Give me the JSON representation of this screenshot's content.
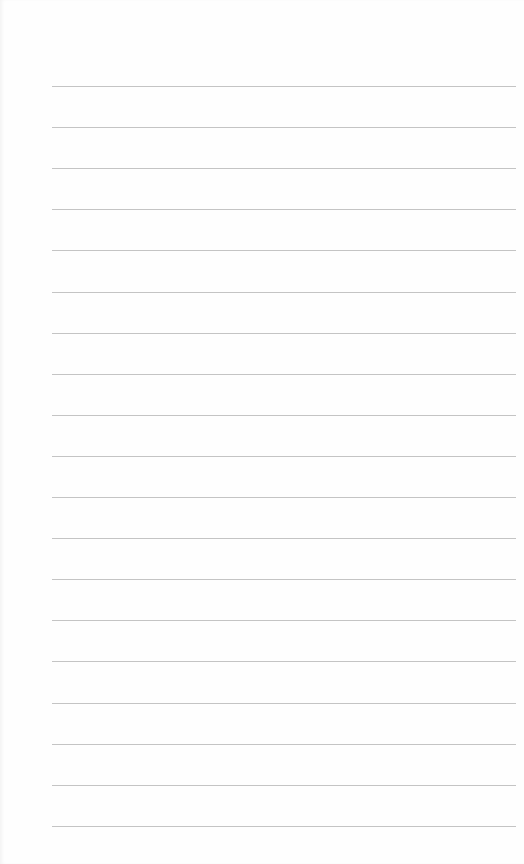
{
  "page": {
    "type": "lined-paper",
    "line_count": 19,
    "first_line_y": 86,
    "line_spacing": 41.1,
    "line_left": 52,
    "line_width": 464,
    "line_color": "#c4c4c4",
    "background_color": "#fefefe"
  }
}
